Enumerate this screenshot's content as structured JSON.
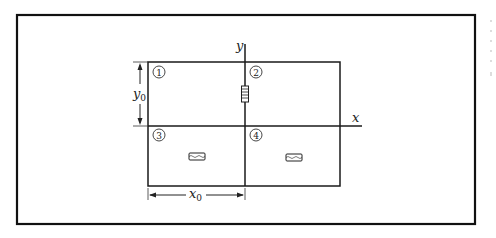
{
  "diagram": {
    "type": "coordinate-quadrant-figure",
    "axes": {
      "x_label": "x",
      "y_label": "y"
    },
    "dimensions": {
      "x0_label": "x",
      "x0_sub": "0",
      "y0_label": "y",
      "y0_sub": "0"
    },
    "quadrants": [
      {
        "number": "1",
        "glyph": "①",
        "resistor": "none"
      },
      {
        "number": "2",
        "glyph": "②",
        "resistor": "vertical"
      },
      {
        "number": "3",
        "glyph": "③",
        "resistor": "horizontal"
      },
      {
        "number": "4",
        "glyph": "④",
        "resistor": "horizontal"
      }
    ],
    "colors": {
      "frame": "#111111",
      "lines": "#1a1a1a",
      "background": "#ffffff"
    }
  }
}
